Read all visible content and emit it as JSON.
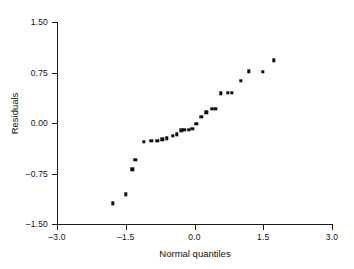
{
  "chart_data": {
    "type": "scatter",
    "title": "",
    "xlabel": "Normal quantiles",
    "ylabel": "Residuals",
    "xlim": [
      -3.0,
      3.0
    ],
    "ylim": [
      -1.5,
      1.5
    ],
    "xticks": [
      "-3.0",
      "-1.5",
      "0.0",
      "1.5",
      "3.0"
    ],
    "xtick_values": [
      -3.0,
      -1.5,
      0.0,
      1.5,
      3.0
    ],
    "yticks": [
      "1.50",
      "0.75",
      "0.00",
      "-0.75",
      "-1.50"
    ],
    "ytick_values": [
      1.5,
      0.75,
      0.0,
      -0.75,
      -1.5
    ],
    "grid": false,
    "legend": false,
    "marker": "filled-square",
    "marker_color": "#0d0d0d",
    "axis_color": "#1a1a1a",
    "background": "#ffffff",
    "points": [
      {
        "x": -1.78,
        "y": -1.19
      },
      {
        "x": -1.5,
        "y": -1.06
      },
      {
        "x": -1.36,
        "y": -0.69
      },
      {
        "x": -1.29,
        "y": -0.55
      },
      {
        "x": -1.1,
        "y": -0.28
      },
      {
        "x": -0.94,
        "y": -0.26
      },
      {
        "x": -0.81,
        "y": -0.26
      },
      {
        "x": -0.7,
        "y": -0.24
      },
      {
        "x": -0.6,
        "y": -0.23
      },
      {
        "x": -0.48,
        "y": -0.19
      },
      {
        "x": -0.38,
        "y": -0.17
      },
      {
        "x": -0.29,
        "y": -0.11
      },
      {
        "x": -0.22,
        "y": -0.1
      },
      {
        "x": -0.13,
        "y": -0.1
      },
      {
        "x": -0.05,
        "y": -0.09
      },
      {
        "x": 0.04,
        "y": -0.01
      },
      {
        "x": 0.15,
        "y": 0.09
      },
      {
        "x": 0.26,
        "y": 0.16
      },
      {
        "x": 0.38,
        "y": 0.21
      },
      {
        "x": 0.45,
        "y": 0.21
      },
      {
        "x": 0.57,
        "y": 0.44
      },
      {
        "x": 0.73,
        "y": 0.45
      },
      {
        "x": 0.82,
        "y": 0.45
      },
      {
        "x": 1.01,
        "y": 0.63
      },
      {
        "x": 1.19,
        "y": 0.77
      },
      {
        "x": 1.49,
        "y": 0.76
      },
      {
        "x": 1.73,
        "y": 0.93
      }
    ]
  },
  "axes": {
    "x_title": "Normal quantiles",
    "y_title": "Residuals"
  }
}
